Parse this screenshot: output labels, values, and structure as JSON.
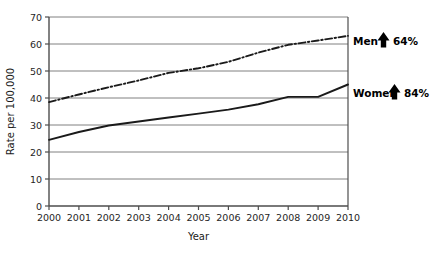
{
  "chart_data": {
    "type": "line",
    "title": "",
    "xlabel": "Year",
    "ylabel": "Rate per 100,000",
    "x": [
      2000,
      2001,
      2002,
      2003,
      2004,
      2005,
      2006,
      2007,
      2008,
      2009,
      2010
    ],
    "xtick_labels": [
      "2000",
      "2001",
      "2002",
      "2003",
      "2004",
      "2005",
      "2006",
      "2007",
      "2008",
      "2009",
      "2010"
    ],
    "ytick_labels": [
      "0",
      "10",
      "20",
      "30",
      "40",
      "50",
      "60",
      "70"
    ],
    "yticks": [
      0,
      10,
      20,
      30,
      40,
      50,
      60,
      70
    ],
    "xlim": [
      2000,
      2010
    ],
    "ylim": [
      0,
      70
    ],
    "grid": "horizontal",
    "legend_position": "right-inline",
    "series": [
      {
        "name": "Men",
        "style": "dash-dot",
        "color": "#1a1a1a",
        "values": [
          38.5,
          41.3,
          44.0,
          46.5,
          49.3,
          51.0,
          53.4,
          56.8,
          59.7,
          61.3,
          63.0
        ]
      },
      {
        "name": "Women",
        "style": "solid",
        "color": "#1a1a1a",
        "values": [
          24.5,
          27.4,
          29.8,
          31.3,
          32.8,
          34.2,
          35.7,
          37.7,
          40.4,
          40.4,
          45.0
        ]
      }
    ],
    "annotations": [
      {
        "label": "Men",
        "arrow": "up-arrow-icon",
        "value": "64%",
        "series": "Men"
      },
      {
        "label": "Women",
        "arrow": "up-arrow-icon",
        "value": "84%",
        "series": "Women"
      }
    ]
  }
}
